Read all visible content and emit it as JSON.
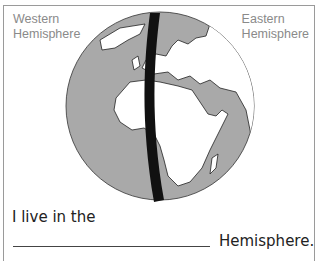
{
  "labels": {
    "west_line1": "Western",
    "west_line2": "Hemisphere",
    "east_line1": "Eastern",
    "east_line2": "Hemisphere"
  },
  "globe": {
    "ocean_color": "#a9a9a9",
    "land_color": "#ffffff",
    "meridian_color": "#111111",
    "description": "Globe centered on Africa and Europe with prime meridian band dividing Western and Eastern hemispheres"
  },
  "worksheet": {
    "sentence_start": "I live in the",
    "sentence_end": "Hemisphere.",
    "answer_value": ""
  }
}
